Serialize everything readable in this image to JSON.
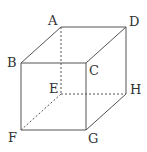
{
  "diagram": {
    "type": "cube",
    "line_color": "#555555",
    "vertices": {
      "A": {
        "label": "A",
        "x": 61,
        "y": 27
      },
      "B": {
        "label": "B",
        "x": 21,
        "y": 63
      },
      "C": {
        "label": "C",
        "x": 86,
        "y": 63
      },
      "D": {
        "label": "D",
        "x": 126,
        "y": 27
      },
      "E": {
        "label": "E",
        "x": 61,
        "y": 94
      },
      "F": {
        "label": "F",
        "x": 21,
        "y": 130
      },
      "G": {
        "label": "G",
        "x": 86,
        "y": 130
      },
      "H": {
        "label": "H",
        "x": 126,
        "y": 94
      }
    },
    "visible_edges": [
      "AB",
      "AD",
      "BC",
      "CD",
      "BF",
      "CG",
      "DH",
      "FG",
      "GH"
    ],
    "hidden_edges": [
      "AE",
      "EF",
      "EH"
    ]
  }
}
